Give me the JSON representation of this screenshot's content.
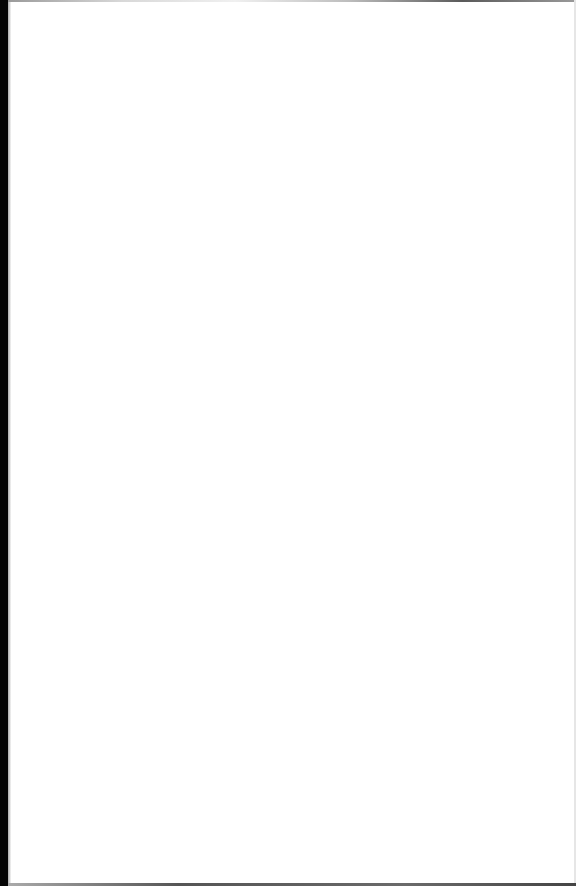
{
  "document": {
    "type": "blank scanned page",
    "content": ""
  }
}
